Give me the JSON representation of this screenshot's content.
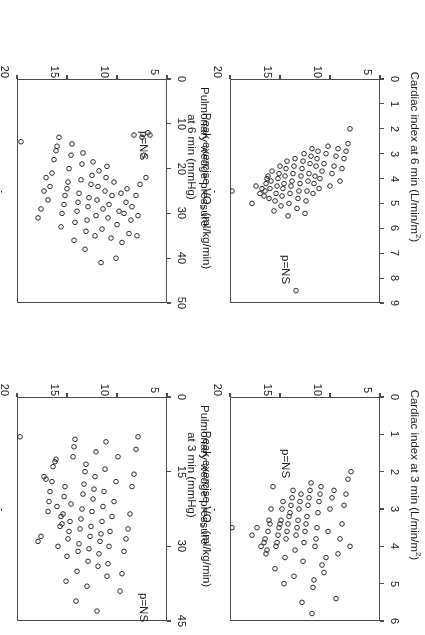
{
  "figure": {
    "rotation_deg": 180,
    "panel_count": 4,
    "marker": "open-circle",
    "marker_color": "#2b2b2b",
    "frame_color": "#4a4a4a",
    "background": "#ffffff"
  },
  "shared": {
    "xlabel_prefix": "Peak exercise V",
    "xlabel_sub": "O",
    "xlabel_sub2": "2",
    "xlabel_suffix": " (ml/kg/min)",
    "xlabel_full": "Peak exercise VO2 (ml/kg/min)",
    "pvalue_label": "p=NS"
  },
  "chart_data": [
    {
      "id": "cardiac-index-3min",
      "type": "scatter",
      "title": "",
      "xlabel": "Peak exercise VO2 (ml/kg/min)",
      "ylabel": "Cardiac index at 3 min (L/min/m2)",
      "ylabel_line1": "Cardiac index at 3 min (L/min/m",
      "ylabel_sup": "2",
      "ylabel_line2": ")",
      "xlim": [
        5,
        20
      ],
      "ylim": [
        0,
        6
      ],
      "xticks": [
        5,
        10,
        15,
        20
      ],
      "yticks": [
        0,
        1,
        2,
        3,
        4,
        5,
        6
      ],
      "grid": false,
      "legend": false,
      "annotation": "p=NS",
      "n": 76,
      "x": [
        19.8,
        17.8,
        17.3,
        16.9,
        16.6,
        16.5,
        16.4,
        16.3,
        16.2,
        16.1,
        16.0,
        15.9,
        15.7,
        15.5,
        15.4,
        15.3,
        15.2,
        15.1,
        15.0,
        14.9,
        14.8,
        14.7,
        14.6,
        14.5,
        14.4,
        14.3,
        14.2,
        14.1,
        14.0,
        13.9,
        13.8,
        13.7,
        13.6,
        13.5,
        13.4,
        13.3,
        13.2,
        13.1,
        13.0,
        12.9,
        12.8,
        12.7,
        12.6,
        12.5,
        12.4,
        12.3,
        12.2,
        12.1,
        12.0,
        11.9,
        11.8,
        11.7,
        11.6,
        11.5,
        11.4,
        11.3,
        11.2,
        11.1,
        11.0,
        10.9,
        10.8,
        10.6,
        10.4,
        10.2,
        10.0,
        9.8,
        9.6,
        9.4,
        9.2,
        9.0,
        8.8,
        8.6,
        8.4,
        8.2,
        8.0,
        7.9
      ],
      "y": [
        3.5,
        3.7,
        3.5,
        4.0,
        3.9,
        3.8,
        4.2,
        4.1,
        3.6,
        3.3,
        3.4,
        3.0,
        2.4,
        4.6,
        4.0,
        3.9,
        3.7,
        3.5,
        3.4,
        3.3,
        3.0,
        2.8,
        5.0,
        4.3,
        3.8,
        3.6,
        3.4,
        3.2,
        3.1,
        2.9,
        2.7,
        2.5,
        4.8,
        4.1,
        3.7,
        3.5,
        3.3,
        3.0,
        2.8,
        2.6,
        5.5,
        4.4,
        3.9,
        3.6,
        3.4,
        3.2,
        2.9,
        2.7,
        2.5,
        2.3,
        5.8,
        5.1,
        4.9,
        4.0,
        3.8,
        3.5,
        3.1,
        2.8,
        2.6,
        2.4,
        4.5,
        4.7,
        4.3,
        3.6,
        3.0,
        2.7,
        2.5,
        5.4,
        4.2,
        3.8,
        3.4,
        2.9,
        2.6,
        2.2,
        4.0,
        2.0
      ]
    },
    {
      "id": "pcwp-3min",
      "type": "scatter",
      "title": "",
      "xlabel": "Peak exercise VO2 (ml/kg/min)",
      "ylabel": "Pulmonary wedge pressure at 3 min (mmHg)",
      "ylabel_line1": "Pulmonary wedge pressure",
      "ylabel_line2": "at 3 min (mmHg)",
      "xlim": [
        5,
        20
      ],
      "ylim": [
        0,
        45
      ],
      "xticks": [
        5,
        10,
        15,
        20
      ],
      "yticks": [
        0,
        15,
        30,
        45
      ],
      "grid": false,
      "legend": false,
      "annotation": "p=NS",
      "n": 78,
      "x": [
        19.7,
        17.9,
        17.6,
        17.3,
        17.1,
        16.9,
        16.8,
        16.7,
        16.5,
        16.4,
        16.2,
        16.1,
        16.0,
        15.9,
        15.7,
        15.6,
        15.5,
        15.4,
        15.3,
        15.2,
        15.1,
        15.0,
        14.9,
        14.8,
        14.7,
        14.6,
        14.4,
        14.3,
        14.2,
        14.1,
        14.0,
        13.9,
        13.8,
        13.7,
        13.6,
        13.5,
        13.4,
        13.3,
        13.2,
        13.1,
        13.0,
        12.9,
        12.8,
        12.7,
        12.6,
        12.5,
        12.4,
        12.3,
        12.2,
        12.1,
        12.0,
        11.9,
        11.8,
        11.7,
        11.6,
        11.5,
        11.4,
        11.3,
        11.2,
        11.1,
        11.0,
        10.9,
        10.8,
        10.7,
        10.5,
        10.3,
        10.1,
        9.9,
        9.7,
        9.5,
        9.3,
        9.1,
        8.9,
        8.7,
        8.5,
        8.3,
        8.1,
        7.9
      ],
      "y": [
        8.0,
        29.0,
        28.0,
        16.0,
        16.5,
        23.0,
        21.0,
        19.0,
        17.0,
        14.0,
        13.0,
        12.5,
        22.0,
        30.0,
        26.0,
        24.0,
        25.5,
        23.5,
        20.0,
        18.0,
        37.0,
        32.0,
        28.5,
        27.0,
        25.0,
        21.5,
        12.0,
        10.0,
        8.5,
        41.0,
        35.0,
        31.0,
        29.5,
        26.5,
        24.5,
        22.5,
        19.5,
        17.5,
        15.0,
        13.5,
        38.0,
        33.0,
        30.5,
        28.0,
        26.0,
        23.0,
        20.5,
        18.5,
        16.0,
        11.0,
        43.0,
        34.0,
        31.5,
        29.0,
        27.5,
        25.0,
        22.0,
        19.0,
        14.5,
        9.0,
        36.0,
        33.5,
        30.0,
        27.0,
        24.0,
        21.0,
        17.0,
        12.0,
        39.0,
        35.5,
        31.0,
        28.5,
        26.5,
        23.5,
        18.0,
        15.5,
        10.5,
        8.0
      ]
    },
    {
      "id": "cardiac-index-6min",
      "type": "scatter",
      "title": "",
      "xlabel": "Peak exercise VO2 (ml/kg/min)",
      "ylabel": "Cardiac index at 6 min (L/min/m2)",
      "ylabel_line1": "Cardiac index at 6 min (L/min/m",
      "ylabel_sup": "2",
      "ylabel_line2": ")",
      "xlim": [
        5,
        20
      ],
      "ylim": [
        0,
        9
      ],
      "xticks": [
        5,
        10,
        15,
        20
      ],
      "yticks": [
        0,
        1,
        2,
        3,
        4,
        5,
        6,
        7,
        8,
        9
      ],
      "grid": false,
      "legend": false,
      "annotation": "p=NS",
      "n": 76,
      "x": [
        19.8,
        17.8,
        17.4,
        17.0,
        16.8,
        16.6,
        16.5,
        16.4,
        16.3,
        16.2,
        16.1,
        16.0,
        15.9,
        15.8,
        15.6,
        15.5,
        15.4,
        15.3,
        15.2,
        15.1,
        15.0,
        14.9,
        14.8,
        14.7,
        14.6,
        14.5,
        14.4,
        14.3,
        14.2,
        14.1,
        14.0,
        13.9,
        13.8,
        13.7,
        13.6,
        13.5,
        13.4,
        13.3,
        13.2,
        13.1,
        13.0,
        12.9,
        12.8,
        12.7,
        12.6,
        12.5,
        12.4,
        12.3,
        12.2,
        12.1,
        12.0,
        11.9,
        11.8,
        11.7,
        11.6,
        11.5,
        11.4,
        11.3,
        11.2,
        11.1,
        11.0,
        10.8,
        10.6,
        10.4,
        10.2,
        10.0,
        9.8,
        9.6,
        9.4,
        9.2,
        9.0,
        8.8,
        8.6,
        8.4,
        8.2,
        8.0
      ],
      "y": [
        4.5,
        5.0,
        4.3,
        4.6,
        4.4,
        4.7,
        4.5,
        4.2,
        4.0,
        3.9,
        4.8,
        4.4,
        4.1,
        3.7,
        5.3,
        4.9,
        4.6,
        4.3,
        4.0,
        3.8,
        3.5,
        5.1,
        4.7,
        4.4,
        4.2,
        3.9,
        3.6,
        3.3,
        5.5,
        5.0,
        4.6,
        4.3,
        4.1,
        3.8,
        3.5,
        3.2,
        8.5,
        5.2,
        4.8,
        4.5,
        4.2,
        3.9,
        3.6,
        3.3,
        3.0,
        5.4,
        4.9,
        4.5,
        4.1,
        3.8,
        3.4,
        3.1,
        2.8,
        4.6,
        4.2,
        3.9,
        3.5,
        3.2,
        2.9,
        4.4,
        4.0,
        3.7,
        3.4,
        3.0,
        2.7,
        4.3,
        3.8,
        3.5,
        3.1,
        2.8,
        4.1,
        3.6,
        3.2,
        2.9,
        2.6,
        2.0
      ]
    },
    {
      "id": "pcwp-6min",
      "type": "scatter",
      "title": "",
      "xlabel": "Peak exercise VO2 (ml/kg/min)",
      "ylabel": "Pulmonary wedge pressure at 6 min (mmHg)",
      "ylabel_line1": "Pulmonary wedge pressure",
      "ylabel_line2": "at 6 min (mmHg)",
      "xlim": [
        5,
        20
      ],
      "ylim": [
        0,
        50
      ],
      "xticks": [
        5,
        10,
        15,
        20
      ],
      "yticks": [
        0,
        10,
        20,
        30,
        40,
        50
      ],
      "grid": false,
      "legend": false,
      "annotation": "p=NS",
      "n": 74,
      "x": [
        19.6,
        17.9,
        17.6,
        17.3,
        17.1,
        16.9,
        16.7,
        16.5,
        16.3,
        16.1,
        16.0,
        15.8,
        15.6,
        15.5,
        15.3,
        15.2,
        15.0,
        14.9,
        14.8,
        14.6,
        14.5,
        14.3,
        14.2,
        14.0,
        13.9,
        13.8,
        13.6,
        13.5,
        13.4,
        13.2,
        13.1,
        13.0,
        12.9,
        12.8,
        12.6,
        12.5,
        12.4,
        12.2,
        12.1,
        12.0,
        11.9,
        11.8,
        11.6,
        11.5,
        11.4,
        11.2,
        11.1,
        11.0,
        10.9,
        10.8,
        10.6,
        10.5,
        10.3,
        10.1,
        10.0,
        9.8,
        9.6,
        9.5,
        9.3,
        9.1,
        9.0,
        8.8,
        8.6,
        8.5,
        8.3,
        8.1,
        8.0,
        7.9,
        7.7,
        7.5,
        7.3,
        7.1,
        6.9,
        6.7
      ],
      "y": [
        14.0,
        31.0,
        29.0,
        25.0,
        22.0,
        27.0,
        24.0,
        21.0,
        18.0,
        16.0,
        15.0,
        13.0,
        33.0,
        30.0,
        28.0,
        26.0,
        24.5,
        23.0,
        20.0,
        17.0,
        14.5,
        36.0,
        32.0,
        29.5,
        27.5,
        25.5,
        22.5,
        19.0,
        16.5,
        38.0,
        34.0,
        31.5,
        28.5,
        26.5,
        23.5,
        21.5,
        18.5,
        35.0,
        30.5,
        27.0,
        24.0,
        20.5,
        41.0,
        33.5,
        29.0,
        25.0,
        22.0,
        19.5,
        31.0,
        28.0,
        35.5,
        26.0,
        23.0,
        40.0,
        32.5,
        29.5,
        25.5,
        36.5,
        30.0,
        27.5,
        24.5,
        34.5,
        31.5,
        28.5,
        12.5,
        26.0,
        35.0,
        30.5,
        23.5,
        13.0,
        17.0,
        22.0,
        12.0,
        12.5
      ]
    }
  ]
}
